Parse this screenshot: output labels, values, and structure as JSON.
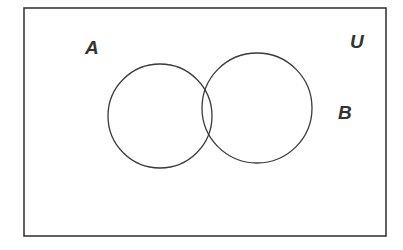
{
  "figure": {
    "type": "venn-diagram",
    "caption": "",
    "background_color": "#ffffff",
    "stroke_color": "#3a3a3a",
    "canvas": {
      "width": 403,
      "height": 250
    }
  },
  "universal_set": {
    "label": "U",
    "label_x": 357,
    "label_y": 48,
    "rect": {
      "x": 24,
      "y": 8,
      "width": 362,
      "height": 228
    },
    "stroke_width": 1.6
  },
  "sets": [
    {
      "id": "A",
      "label": "A",
      "label_x": 92,
      "label_y": 54,
      "cx": 160,
      "cy": 116,
      "r": 52,
      "stroke_width": 1.3
    },
    {
      "id": "B",
      "label": "B",
      "label_x": 345,
      "label_y": 119,
      "cx": 257,
      "cy": 108,
      "r": 55,
      "stroke_width": 1.3
    }
  ],
  "regions": [
    {
      "name": "A-only"
    },
    {
      "name": "A-intersect-B"
    },
    {
      "name": "B-only"
    },
    {
      "name": "outside-both"
    }
  ]
}
